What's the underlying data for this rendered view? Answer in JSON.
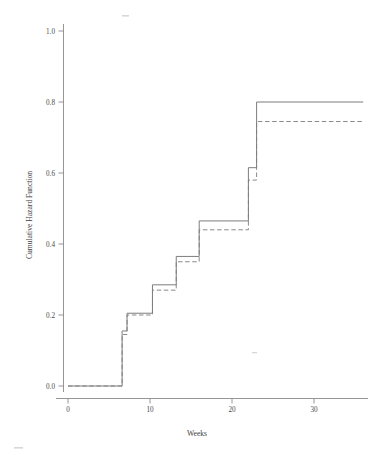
{
  "chart_data": {
    "type": "line",
    "subtype": "step",
    "title": "",
    "xlabel": "Weeks",
    "ylabel": "Cumulative Hazard Function",
    "xlim": [
      -1.5,
      36.5
    ],
    "ylim": [
      -0.03,
      1.06
    ],
    "xticks": [
      0,
      10,
      20,
      30
    ],
    "xticklabels": [
      "0",
      "10",
      "20",
      "30"
    ],
    "yticks": [
      0.0,
      0.2,
      0.4,
      0.6,
      0.8,
      1.0
    ],
    "yticklabels": [
      "0.0",
      "0.2",
      "0.4",
      "0.6",
      "0.8",
      "1.0"
    ],
    "grid": false,
    "legend": "none",
    "series": [
      {
        "name": "solid-step-curve",
        "style": "solid",
        "color": "#7d7d7d",
        "x": [
          0,
          6.6,
          6.6,
          7.2,
          7.2,
          10.3,
          10.3,
          13.2,
          13.2,
          16.0,
          16.0,
          22.0,
          22.0,
          23.0,
          23.0,
          36.0
        ],
        "y": [
          0.0,
          0.0,
          0.155,
          0.155,
          0.205,
          0.205,
          0.285,
          0.285,
          0.365,
          0.365,
          0.465,
          0.465,
          0.615,
          0.615,
          0.8,
          0.8
        ]
      },
      {
        "name": "dashed-step-curve",
        "style": "dashed",
        "color": "#8a8a8a",
        "x": [
          0,
          6.6,
          6.6,
          7.2,
          7.2,
          10.3,
          10.3,
          13.2,
          13.2,
          16.0,
          16.0,
          22.0,
          22.0,
          23.0,
          23.0,
          36.0
        ],
        "y": [
          0.0,
          0.0,
          0.145,
          0.145,
          0.2,
          0.2,
          0.27,
          0.27,
          0.35,
          0.35,
          0.44,
          0.44,
          0.58,
          0.58,
          0.745,
          0.745
        ]
      }
    ],
    "annotations": []
  }
}
